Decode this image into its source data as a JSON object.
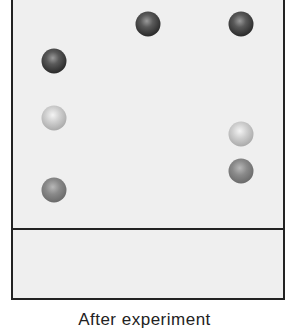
{
  "diagram": {
    "type": "tlc-plate",
    "caption": "After experiment",
    "colors": {
      "plate_background": "#efefef",
      "border": "#222222",
      "spot_dark": "#2e2e2e",
      "spot_medium": "#777777",
      "spot_light": "#c8c8c8"
    },
    "lanes": [
      {
        "lane": 1,
        "x": 54,
        "spots": [
          {
            "shade": "dark",
            "y": 61
          },
          {
            "shade": "light",
            "y": 118
          },
          {
            "shade": "medium",
            "y": 190
          }
        ]
      },
      {
        "lane": 2,
        "x": 148,
        "spots": [
          {
            "shade": "dark",
            "y": 24
          }
        ]
      },
      {
        "lane": 3,
        "x": 241,
        "spots": [
          {
            "shade": "dark",
            "y": 24
          },
          {
            "shade": "light",
            "y": 134
          },
          {
            "shade": "medium",
            "y": 171
          }
        ]
      }
    ]
  }
}
